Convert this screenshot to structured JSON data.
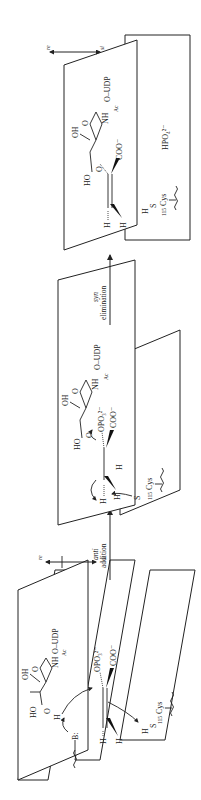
{
  "figure": {
    "orientation": "rotated 90 degrees counter-clockwise",
    "steps": [
      {
        "label_italic": "anti",
        "label": "addition"
      },
      {
        "label_italic": "syn",
        "label": "elimination"
      }
    ],
    "face_labels": {
      "re": "re",
      "si": "si"
    },
    "stage1": {
      "base": "B:",
      "sugar": {
        "oh": "OH",
        "ho": "HO",
        "ring_o": "O",
        "nh": "NH",
        "ac": "Ac",
        "oudp": "O–UDP",
        "o3": "O",
        "h": "H"
      },
      "enol": {
        "h_top": "H",
        "h_bottom": "H",
        "opo3": "OPO₃²⁻",
        "coo": "COO⁻"
      },
      "cys": {
        "h": "H",
        "s": "S",
        "cys": "Cys",
        "num": "115"
      }
    },
    "stage2": {
      "sugar": {
        "oh": "OH",
        "ho": "HO",
        "ring_o": "O",
        "nh": "NH",
        "ac": "Ac",
        "oudp": "O–UDP",
        "o3": "O"
      },
      "center": {
        "h_top": "H",
        "h_bottom": "H",
        "h_right": "H",
        "opo3": "OPO₃²⁻",
        "coo": "COO⁻"
      },
      "cys": {
        "s": "S",
        "cys": "Cys",
        "num": "115"
      }
    },
    "stage3": {
      "sugar": {
        "oh": "OH",
        "ho": "HO",
        "ring_o": "O",
        "nh": "NH",
        "ac": "Ac",
        "oudp": "O–UDP",
        "o3": "O"
      },
      "enol": {
        "h_top": "H",
        "h_bottom": "H",
        "coo": "COO⁻"
      },
      "cys": {
        "h": "H",
        "s": "S",
        "cys": "Cys",
        "num": "115"
      },
      "phosphate": "HPO₄²⁻"
    }
  }
}
